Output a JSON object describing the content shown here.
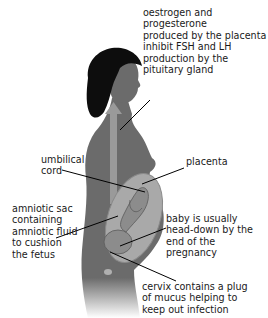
{
  "diagram": {
    "colors": {
      "body": "#6b6b6b",
      "hair": "#0d0d0d",
      "uterus": "#a9a9a9",
      "arrow": "#9a9a9a",
      "leader_lines": "#000000",
      "text": "#1a1a1a"
    },
    "labels": {
      "hormones": "oestrogen and progesterone\nproduced by the placenta\ninhibit FSH and LH\nproduction by the\npituitary gland",
      "umbilical_cord": "umbilical\ncord",
      "placenta": "placenta",
      "amniotic_sac": "amniotic sac\ncontaining\namniotic fluid\nto cushion\nthe fetus",
      "baby_position": "baby is usually\nhead-down by the\nend of the pregnancy",
      "cervix": "cervix contains a plug\nof mucus helping to\nkeep out infection"
    }
  }
}
